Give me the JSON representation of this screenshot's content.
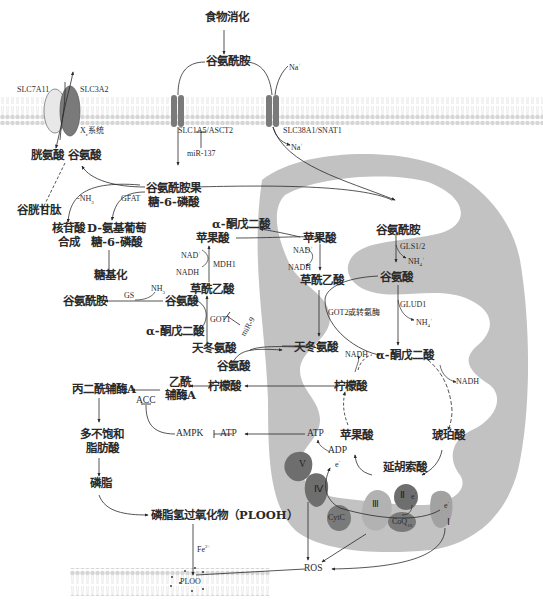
{
  "diagram": {
    "type": "metabolic-pathway",
    "topic": "glutamine metabolism and ferroptosis",
    "colors": {
      "membrane": "#d8d8d8",
      "membrane_dark": "#c4c4c4",
      "mito_outer": "#bfbfbf",
      "mito_inner": "#ffffff",
      "transporter_dark": "#7a7a7a",
      "transporter_light": "#e6e6e6",
      "complex_dark": "#6e6e6e",
      "complex_light": "#9a9a9a",
      "line": "#2a2a2a"
    }
  },
  "top": {
    "food_digestion": "食物消化",
    "glutamine_extra": "谷氨酰胺",
    "na_in": "Na",
    "na_in_sup": "+",
    "na_out": "Na",
    "na_out_sup": "+"
  },
  "transporters": {
    "slc7a11": "SLC7A11",
    "slc3a2": "SLC3A2",
    "xc_system": "X",
    "xc_sub": "c",
    "xc_suffix": "系统",
    "slc1a5": "SLC1A5/ASCT2",
    "slc38a1": "SLC38A1/SNAT1",
    "mir137": "miR-137"
  },
  "cytosol": {
    "cystine": "胱氨酸",
    "glutamate_top": "谷氨酸",
    "glutathione": "谷胱甘肽",
    "nh3_label": "-NH",
    "nh3_sub": "3",
    "gfat": "GFAT",
    "f6p_line1": "谷氨酰胺果",
    "f6p_line2": "糖-6-磷酸",
    "nucleotide_line1": "核苷酸",
    "nucleotide_line2": "合成",
    "glcn6p_line1": "D-氨基葡萄",
    "glcn6p_line2": "糖-6-磷酸",
    "glycosylation": "糖基化",
    "akg_top": "α-酮戊二酸",
    "malate": "苹果酸",
    "nad": "NAD",
    "nad_sup": "+",
    "nadh": "NADH",
    "mdh1": "MDH1",
    "oaa": "草酰乙酸",
    "glutamine_gs": "谷氨酰胺",
    "gs": "GS",
    "nh3_gs": "NH",
    "nh3_gs_sub": "3",
    "glutamate_mid": "谷氨酸",
    "got1": "GOT1",
    "mir9": "miR-9",
    "akg_mid": "α-酮戊二酸",
    "aspartate": "天冬氨酸",
    "glutamate_low": "谷氨酸",
    "malonyl_coa": "丙二酰辅酶A",
    "acetyl_coa_line1": "乙酰",
    "acetyl_coa_line2": "辅酶A",
    "acc": "ACC",
    "citrate_cyto": "柠檬酸",
    "pufa_line1": "多不饱和",
    "pufa_line2": "脂肪酸",
    "ampk": "AMPK",
    "atp_cyto": "ATP",
    "phospholipid": "磷脂",
    "plooh": "磷脂氢过氧化物（PLOOH）",
    "fe": "Fe",
    "fe_sup": "2+",
    "ploo": "PLOO",
    "ros": "ROS"
  },
  "mitochondria": {
    "glutamine": "谷氨酰胺",
    "gls": "GLS1/2",
    "nh4_1": "NH",
    "nh4_1_sub": "4",
    "nh4_1_sup": "+",
    "glutamate": "谷氨酸",
    "glud1": "GLUD1",
    "nh4_2": "NH",
    "nh4_2_sub": "4",
    "nh4_2_sup": "+",
    "malate": "苹果酸",
    "nad": "NAD",
    "nad_sup": "+",
    "nadh": "NADH",
    "oaa": "草酰乙酸",
    "got2": "GOT2或转氨酶",
    "aspartate": "天冬氨酸",
    "nadh_akg": "NADH",
    "akg": "α-酮戊二酸",
    "nadh_tca": "NADH",
    "citrate": "柠檬酸",
    "atp": "ATP",
    "adp": "ADP",
    "malate_tca": "苹果酸",
    "succinate": "琥珀酸",
    "fumarate": "延胡索酸",
    "electron1": "e",
    "electron2": "e",
    "electron3": "e",
    "electron_sup": "-",
    "complex_v": "V",
    "complex_iv": "Ⅳ",
    "complex_iii": "Ⅲ",
    "complex_ii": "Ⅱ",
    "complex_i": "Ⅰ",
    "cytc": "CytC",
    "coq": "CoQ",
    "coq_sub": "10"
  }
}
